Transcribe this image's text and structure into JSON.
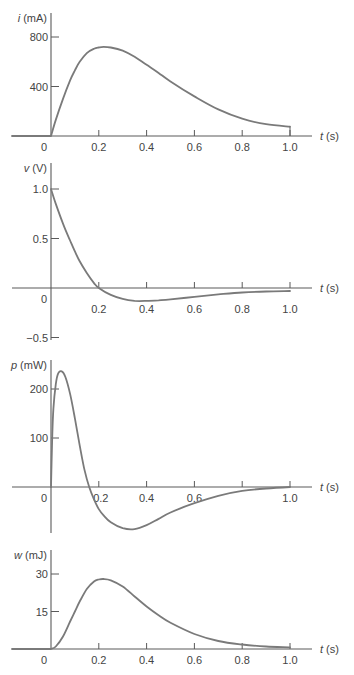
{
  "chart_data": [
    {
      "type": "line",
      "title": "",
      "ylabel_var": "i",
      "ylabel": "i (mA)",
      "xlabel_var": "t",
      "xlabel": "t (s)",
      "x_ticks": [
        0.2,
        0.4,
        0.6,
        0.8,
        1.0
      ],
      "x_tick_labels": [
        "0",
        "0.2",
        "0.4",
        "0.6",
        "0.8",
        "1.0"
      ],
      "y_ticks": [
        400,
        800
      ],
      "y_tick_labels": [
        "400",
        "800"
      ],
      "ylim": [
        0,
        900
      ],
      "xlim": [
        0,
        1.0
      ],
      "grid": false,
      "x": [
        0,
        0.02,
        0.05,
        0.08,
        0.1,
        0.12,
        0.15,
        0.18,
        0.2,
        0.22,
        0.25,
        0.3,
        0.35,
        0.4,
        0.45,
        0.5,
        0.6,
        0.7,
        0.8,
        0.9,
        1.0
      ],
      "values": [
        0,
        130,
        300,
        450,
        530,
        600,
        670,
        705,
        715,
        720,
        715,
        690,
        640,
        575,
        510,
        440,
        320,
        215,
        140,
        95,
        75
      ]
    },
    {
      "type": "line",
      "title": "",
      "ylabel_var": "v",
      "ylabel": "v (V)",
      "xlabel_var": "t",
      "xlabel": "t (s)",
      "x_ticks": [
        0.2,
        0.4,
        0.6,
        0.8,
        1.0
      ],
      "x_tick_labels": [
        "0",
        "0.2",
        "0.4",
        "0.6",
        "0.8",
        "1.0"
      ],
      "y_ticks": [
        -0.5,
        0.5,
        1.0
      ],
      "y_tick_labels": [
        "−0.5",
        "0.5",
        "1.0"
      ],
      "ylim": [
        -0.55,
        1.2
      ],
      "xlim": [
        0,
        1.0
      ],
      "grid": false,
      "x": [
        0,
        0.02,
        0.05,
        0.08,
        0.1,
        0.12,
        0.15,
        0.18,
        0.2,
        0.25,
        0.3,
        0.35,
        0.4,
        0.45,
        0.5,
        0.6,
        0.7,
        0.8,
        0.9,
        1.0
      ],
      "values": [
        1.0,
        0.85,
        0.65,
        0.48,
        0.37,
        0.27,
        0.15,
        0.05,
        0.0,
        -0.07,
        -0.11,
        -0.13,
        -0.13,
        -0.125,
        -0.115,
        -0.09,
        -0.065,
        -0.045,
        -0.035,
        -0.03
      ]
    },
    {
      "type": "line",
      "title": "",
      "ylabel_var": "p",
      "ylabel": "p (mW)",
      "xlabel_var": "t",
      "xlabel": "t (s)",
      "x_ticks": [
        0.2,
        0.4,
        0.6,
        0.8,
        1.0
      ],
      "x_tick_labels": [
        "0",
        "0.2",
        "0.4",
        "0.6",
        "1.0"
      ],
      "y_ticks": [
        100,
        200
      ],
      "y_tick_labels": [
        "100",
        "200"
      ],
      "ylim": [
        -90,
        260
      ],
      "xlim": [
        0,
        1.0
      ],
      "grid": false,
      "x": [
        0,
        0.005,
        0.01,
        0.02,
        0.03,
        0.045,
        0.06,
        0.08,
        0.1,
        0.12,
        0.14,
        0.16,
        0.18,
        0.2,
        0.22,
        0.25,
        0.3,
        0.35,
        0.4,
        0.45,
        0.5,
        0.6,
        0.7,
        0.8,
        0.9,
        1.0
      ],
      "values": [
        0,
        100,
        160,
        210,
        232,
        236,
        225,
        190,
        140,
        85,
        35,
        0,
        -25,
        -45,
        -58,
        -72,
        -84,
        -86,
        -78,
        -65,
        -52,
        -33,
        -18,
        -8,
        -3,
        0
      ]
    },
    {
      "type": "line",
      "title": "",
      "ylabel_var": "w",
      "ylabel": "w (mJ)",
      "xlabel_var": "t",
      "xlabel": "t (s)",
      "x_ticks": [
        0.2,
        0.4,
        0.6,
        0.8,
        1.0
      ],
      "x_tick_labels": [
        "0",
        "0.2",
        "0.4",
        "0.6",
        "0.8",
        "1.0"
      ],
      "y_ticks": [
        15,
        30
      ],
      "y_tick_labels": [
        "15",
        "30"
      ],
      "ylim": [
        0,
        35
      ],
      "xlim": [
        0,
        1.0
      ],
      "grid": false,
      "x": [
        0,
        0.02,
        0.05,
        0.08,
        0.1,
        0.12,
        0.15,
        0.18,
        0.2,
        0.22,
        0.25,
        0.3,
        0.35,
        0.4,
        0.45,
        0.5,
        0.6,
        0.7,
        0.8,
        0.9,
        1.0
      ],
      "values": [
        0,
        1,
        5,
        11,
        15,
        19,
        24,
        27,
        27.8,
        28,
        27.5,
        25,
        21,
        17,
        13.5,
        10.5,
        6,
        3.2,
        1.8,
        1.0,
        0.7
      ]
    }
  ]
}
